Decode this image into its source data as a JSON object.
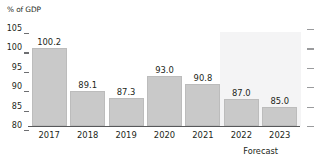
{
  "chart_data": {
    "type": "bar",
    "title": "",
    "ylabel": "% of GDP",
    "xlabel": "",
    "categories": [
      "2017",
      "2018",
      "2019",
      "2020",
      "2021",
      "2022",
      "2023"
    ],
    "values": [
      100.2,
      89.1,
      87.3,
      93.0,
      90.8,
      87.0,
      85.0
    ],
    "value_labels": [
      "100.2",
      "89.1",
      "87.3",
      "93.0",
      "90.8",
      "87.0",
      "85.0"
    ],
    "ylim": [
      80,
      105
    ],
    "yticks": [
      105,
      100,
      95,
      90,
      85,
      80
    ],
    "ytick_labels": [
      "105",
      "100",
      "95",
      "90",
      "85",
      "80"
    ],
    "right_axis_ticks": [
      105,
      100,
      95,
      90,
      85,
      80
    ],
    "grid": false,
    "legend": null,
    "annotations": [
      {
        "text": "Forecast",
        "covers_categories": [
          "2022",
          "2023"
        ],
        "shaded_band": true
      }
    ],
    "bar_color": "#c9c9c9",
    "forecast_band_color": "#f4f4f5",
    "axis_color": "#57585a",
    "text_color": "#231f20"
  },
  "axis": {
    "unit_label": "% of GDP"
  },
  "forecast": {
    "label": "Forecast"
  }
}
